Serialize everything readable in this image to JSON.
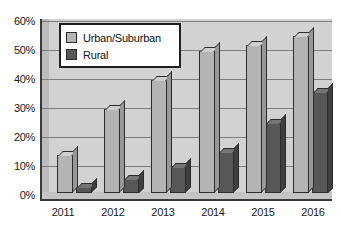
{
  "chart_data": {
    "type": "bar",
    "title": "",
    "subtitle": "",
    "xlabel": "",
    "ylabel": "",
    "categories": [
      "2011",
      "2012",
      "2013",
      "2014",
      "2015",
      "2016"
    ],
    "series": [
      {
        "name": "Urban/Suburban",
        "color": "#b4b4b4",
        "values": [
          13,
          29,
          39,
          49,
          51,
          54
        ]
      },
      {
        "name": "Rural",
        "color": "#575757",
        "values": [
          2,
          5,
          9,
          14,
          24,
          35
        ]
      }
    ],
    "ylim": [
      0,
      60
    ],
    "y_ticks": [
      "0%",
      "10%",
      "20%",
      "30%",
      "40%",
      "50%",
      "60%"
    ],
    "y_tick_values": [
      0,
      10,
      20,
      30,
      40,
      50,
      60
    ],
    "grid": true,
    "legend_position": "top-left",
    "value_suffix": "%",
    "plot_background": "#d2d2d2",
    "axis_color": "#3a3a3a",
    "gridline_color": "#7d7d7d"
  }
}
